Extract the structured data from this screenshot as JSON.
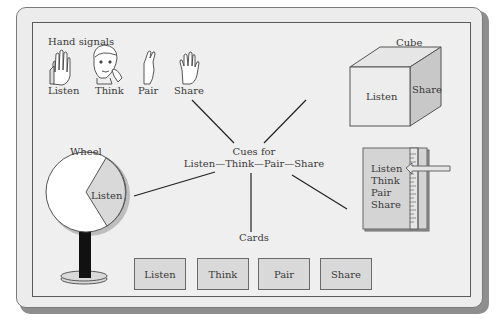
{
  "hand_signals": {
    "title": "Hand signals",
    "items": [
      {
        "label": "Listen",
        "icon": "raised-hand-icon"
      },
      {
        "label": "Think",
        "icon": "thinking-face-icon"
      },
      {
        "label": "Pair",
        "icon": "crossed-fingers-icon"
      },
      {
        "label": "Share",
        "icon": "open-hand-icon"
      }
    ]
  },
  "cube": {
    "title": "Cube",
    "front": "Listen",
    "side": "Share"
  },
  "center": {
    "line1": "Cues for",
    "line2": "Listen—Think—Pair—Share"
  },
  "wheel": {
    "title": "Wheel",
    "segment": "Listen"
  },
  "ruler_card": {
    "items": [
      "Listen",
      "Think",
      "Pair",
      "Share"
    ]
  },
  "cards": {
    "title": "Cards",
    "items": [
      "Listen",
      "Think",
      "Pair",
      "Share"
    ]
  },
  "colors": {
    "background": "#ececec",
    "shade": "#d9d9d9",
    "side_face": "#c8c8c8",
    "stand": "#111111"
  }
}
